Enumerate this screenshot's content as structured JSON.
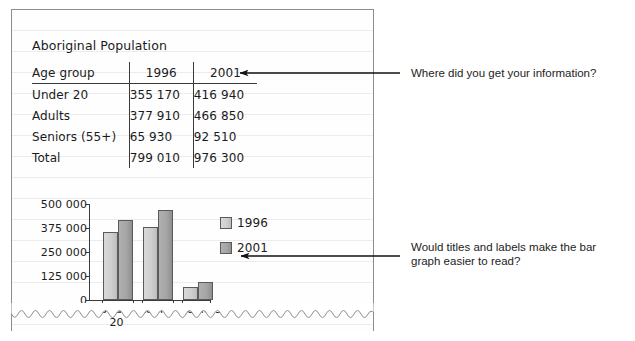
{
  "worksheet": {
    "title": "Aboriginal Population"
  },
  "table": {
    "headers": [
      "Age group",
      "1996",
      "2001"
    ],
    "rows": [
      {
        "label": "Under 20",
        "y1996": "355 170",
        "y2001": "416 940"
      },
      {
        "label": "Adults",
        "y1996": "377 910",
        "y2001": "466 850"
      },
      {
        "label": "Seniors (55+)",
        "y1996": "65 930",
        "y2001": "92 510"
      },
      {
        "label": "Total",
        "y1996": "799 010",
        "y2001": "976 300"
      }
    ]
  },
  "chart_data": {
    "type": "bar",
    "title": "",
    "xlabel": "",
    "ylabel": "",
    "categories": [
      "Under 20",
      "Adults",
      "Seniors"
    ],
    "category_lines": [
      [
        "Under",
        "20"
      ],
      [
        "Adults",
        ""
      ],
      [
        "Seniors",
        ""
      ]
    ],
    "series": [
      {
        "name": "1996",
        "values": [
          355170,
          377910,
          65930
        ],
        "color": "#cfcfcf"
      },
      {
        "name": "2001",
        "values": [
          416940,
          466850,
          92510
        ],
        "color": "#a6a6a6"
      }
    ],
    "ylim": [
      0,
      500000
    ],
    "yticks": [
      0,
      125000,
      250000,
      375000,
      500000
    ],
    "ytick_labels": [
      "0",
      "125 000",
      "250 000",
      "375 000",
      "500 000"
    ],
    "grid": false,
    "legend_position": "right"
  },
  "annotations": [
    {
      "id": "source-question",
      "text": "Where did you get your information?",
      "lines": [
        "Where did you get your information?"
      ]
    },
    {
      "id": "labels-question",
      "text": "Would titles and labels make the bar graph easier to read?",
      "lines": [
        "Would titles and labels make the bar",
        "graph easier to read?"
      ]
    }
  ]
}
